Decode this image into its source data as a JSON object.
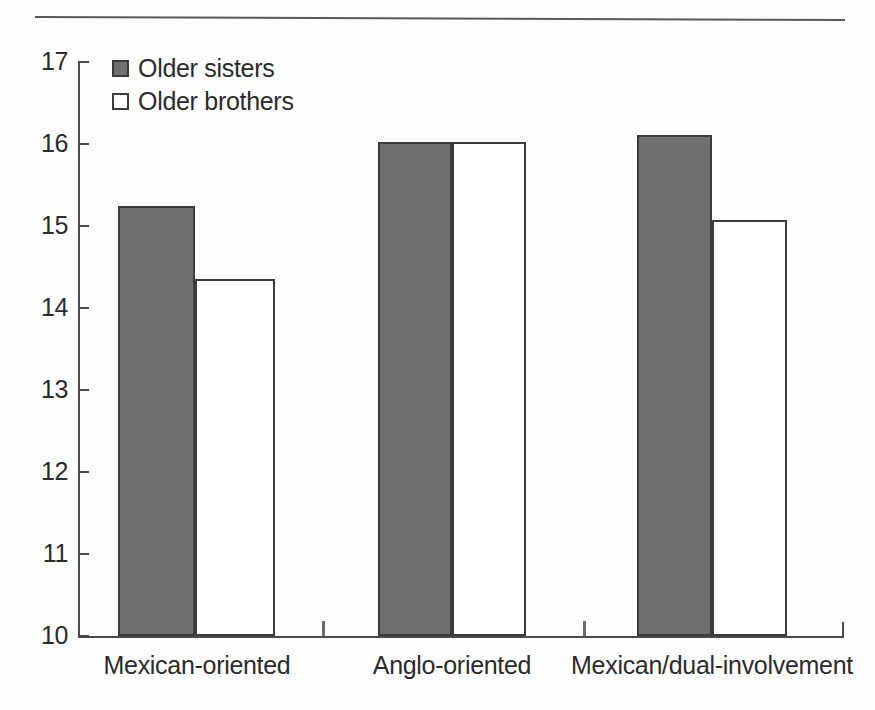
{
  "chart_data": {
    "type": "bar",
    "title": "",
    "subtitle": "",
    "xlabel": "",
    "ylabel": "",
    "categories": [
      "Mexican-oriented",
      "Anglo-oriented",
      "Mexican/dual-involvement"
    ],
    "series": [
      {
        "name": "Older sisters",
        "values": [
          15.25,
          16.02,
          16.11
        ],
        "color": "#707070"
      },
      {
        "name": "Older brothers",
        "values": [
          14.35,
          16.02,
          15.07
        ],
        "color": "#ffffff"
      }
    ],
    "ylim": [
      10,
      17
    ],
    "yticks": [
      17,
      16,
      15,
      14,
      13,
      12,
      11,
      10
    ],
    "ytick_labels": [
      "17",
      "16",
      "15",
      "14",
      "13",
      "12",
      "11",
      "10"
    ],
    "grid": false,
    "legend_position": "top-left",
    "axis_color": "#4a4a4a",
    "bar_edge_color": "#3b3b3b"
  },
  "legend": {
    "items": [
      {
        "label": "Older sisters",
        "swatch": "filled-gray-square-icon"
      },
      {
        "label": "Older brothers",
        "swatch": "outline-white-square-icon"
      }
    ]
  },
  "decorations": {
    "top_rule": "horizontal-rule"
  }
}
